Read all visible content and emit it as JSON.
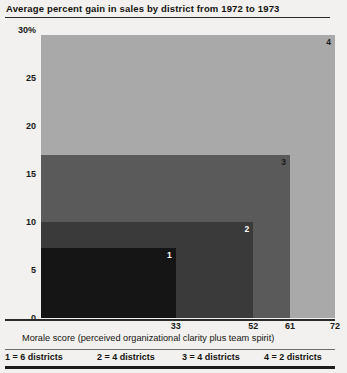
{
  "chart_data": {
    "type": "bar",
    "title": "Average percent gain in sales by district from 1972 to 1973",
    "xlabel": "Morale score (perceived organizational clarity plus team spirit)",
    "ylabel": "",
    "categories": [
      "1",
      "2",
      "3",
      "4"
    ],
    "values": [
      7.3,
      10.0,
      17.0,
      29.5
    ],
    "x_right_edges": [
      33,
      52,
      61,
      72
    ],
    "ylim": [
      0,
      30
    ],
    "xlim": [
      0,
      72
    ],
    "ytick_labels": [
      "30%",
      "25",
      "20",
      "15",
      "10",
      "5",
      "0"
    ],
    "ytick_values": [
      30,
      25,
      20,
      15,
      10,
      5,
      0
    ],
    "xtick_labels": [
      "33",
      "52",
      "61",
      "72"
    ],
    "xtick_values": [
      33,
      52,
      61,
      72
    ],
    "grid": false,
    "legend_position": "bottom",
    "legend": [
      "1 = 6  districts",
      "2 = 4 districts",
      "3 = 4 districts",
      "4 = 2 districts"
    ],
    "series_colors": [
      "#151515",
      "#3a3a3a",
      "#5a5a5a",
      "#a9a9a9"
    ],
    "bar_label_colors": [
      "#ffffff",
      "#ffffff",
      "#1a1a1a",
      "#1a1a1a"
    ],
    "annotations": [
      "1",
      "2",
      "3",
      "4"
    ],
    "background_color": "#f2f1ef",
    "axis_color": "#2a2a28"
  }
}
